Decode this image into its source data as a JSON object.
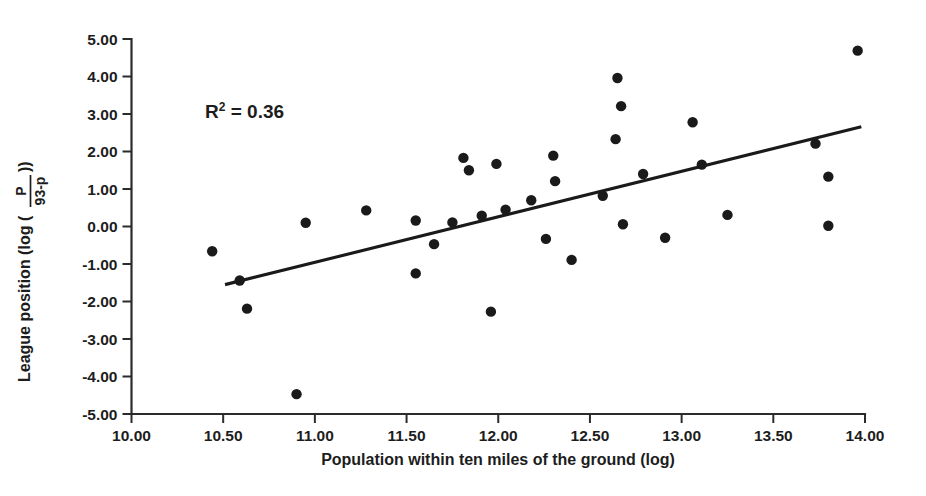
{
  "chart_data": {
    "type": "scatter",
    "title": "",
    "xlabel": "Population within ten miles of the ground (log)",
    "ylabel": "League position (log ( P / 93-p ))",
    "ylabel_parts": {
      "prefix": "League position (log (",
      "numerator": "P",
      "denominator": "93-p",
      "suffix": "))"
    },
    "xlim": [
      10.0,
      14.0
    ],
    "ylim": [
      -5.0,
      5.0
    ],
    "xticks": [
      10.0,
      10.5,
      11.0,
      11.5,
      12.0,
      12.5,
      13.0,
      13.5,
      14.0
    ],
    "yticks": [
      5.0,
      4.0,
      3.0,
      2.0,
      1.0,
      0.0,
      -1.0,
      -2.0,
      -3.0,
      -4.0,
      -5.0
    ],
    "xticklabels": [
      "10.00",
      "10.50",
      "11.00",
      "11.50",
      "12.00",
      "12.50",
      "13.00",
      "13.50",
      "14.00"
    ],
    "yticklabels": [
      "5.00",
      "4.00",
      "3.00",
      "2.00",
      "1.00",
      "0.00",
      "-1.00",
      "-2.00",
      "-3.00",
      "-4.00",
      "-5.00"
    ],
    "grid": false,
    "legend": false,
    "marker_color": "#1a1a1a",
    "marker_radius": 5.2,
    "annotations": [
      {
        "id": "r-squared",
        "text_prefix": "R",
        "text_sup": "2",
        "text_suffix": " = 0.36",
        "x": 10.4,
        "y": 3.0
      }
    ],
    "trendline": {
      "type": "linear",
      "color": "#1a1a1a",
      "x_start": 10.51,
      "y_start": -1.55,
      "x_end": 13.98,
      "y_end": 2.66,
      "r_squared": 0.36
    },
    "points": [
      {
        "x": 10.44,
        "y": -0.66
      },
      {
        "x": 10.59,
        "y": -1.44
      },
      {
        "x": 10.63,
        "y": -2.19
      },
      {
        "x": 10.9,
        "y": -4.47
      },
      {
        "x": 10.95,
        "y": 0.1
      },
      {
        "x": 11.28,
        "y": 0.43
      },
      {
        "x": 11.55,
        "y": 0.16
      },
      {
        "x": 11.55,
        "y": -1.25
      },
      {
        "x": 11.65,
        "y": -0.47
      },
      {
        "x": 11.75,
        "y": 0.11
      },
      {
        "x": 11.81,
        "y": 1.83
      },
      {
        "x": 11.84,
        "y": 1.5
      },
      {
        "x": 11.91,
        "y": 0.29
      },
      {
        "x": 11.96,
        "y": -2.27
      },
      {
        "x": 11.99,
        "y": 1.67
      },
      {
        "x": 12.04,
        "y": 0.45
      },
      {
        "x": 12.18,
        "y": 0.7
      },
      {
        "x": 12.26,
        "y": -0.33
      },
      {
        "x": 12.3,
        "y": 1.89
      },
      {
        "x": 12.31,
        "y": 1.21
      },
      {
        "x": 12.4,
        "y": -0.89
      },
      {
        "x": 12.57,
        "y": 0.82
      },
      {
        "x": 12.64,
        "y": 2.33
      },
      {
        "x": 12.65,
        "y": 3.96
      },
      {
        "x": 12.67,
        "y": 3.21
      },
      {
        "x": 12.68,
        "y": 0.06
      },
      {
        "x": 12.79,
        "y": 1.4
      },
      {
        "x": 12.91,
        "y": -0.3
      },
      {
        "x": 13.06,
        "y": 2.78
      },
      {
        "x": 13.11,
        "y": 1.65
      },
      {
        "x": 13.25,
        "y": 0.31
      },
      {
        "x": 13.73,
        "y": 2.21
      },
      {
        "x": 13.8,
        "y": 1.33
      },
      {
        "x": 13.8,
        "y": 0.02
      },
      {
        "x": 13.96,
        "y": 4.69
      }
    ]
  },
  "figure": {
    "background": "#ffffff",
    "axis_color": "#2b2b2b"
  }
}
